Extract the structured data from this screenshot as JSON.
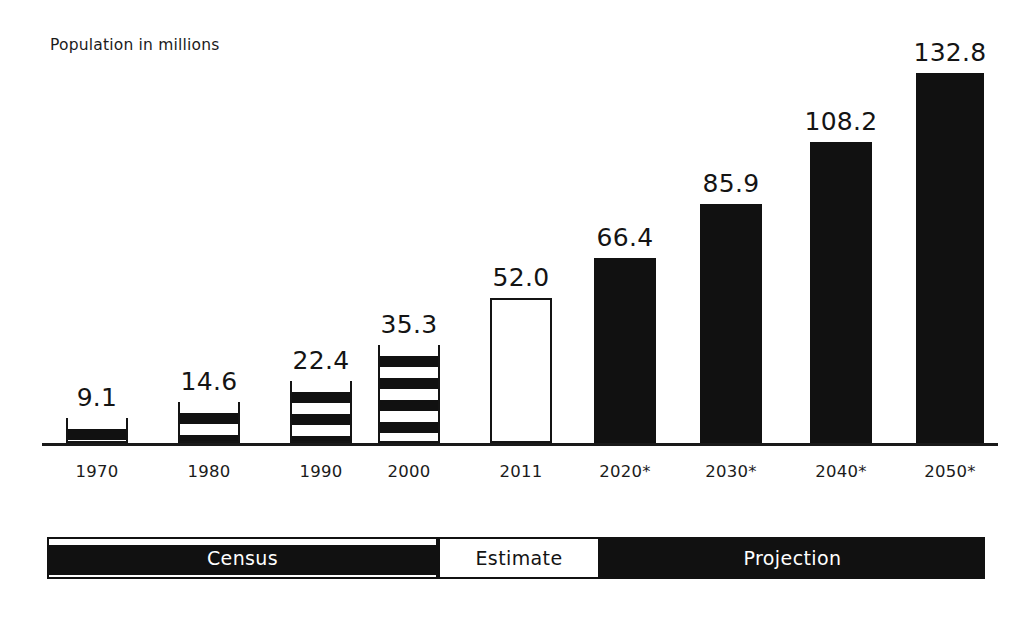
{
  "chart_data": {
    "type": "bar",
    "title": "",
    "subtitle": "",
    "ylabel": "Population in millions",
    "xlabel": "",
    "categories": [
      "1970",
      "1980",
      "1990",
      "2000",
      "2011",
      "2020*",
      "2030*",
      "2040*",
      "2050*"
    ],
    "values": [
      9.1,
      14.6,
      22.4,
      35.3,
      52.0,
      66.4,
      85.9,
      108.2,
      132.8
    ],
    "value_labels": [
      "9.1",
      "14.6",
      "22.4",
      "35.3",
      "52.0",
      "66.4",
      "85.9",
      "108.2",
      "132.8"
    ],
    "series": [
      {
        "name": "Population in millions",
        "values": [
          9.1,
          14.6,
          22.4,
          35.3,
          52.0,
          66.4,
          85.9,
          108.2,
          132.8
        ]
      }
    ],
    "bar_styles": [
      "striped",
      "striped",
      "striped",
      "striped",
      "hollow",
      "solid",
      "solid",
      "solid",
      "solid"
    ],
    "categories_by_group": {
      "Census": [
        "1970",
        "1980",
        "1990",
        "2000"
      ],
      "Estimate": [
        "2011"
      ],
      "Projection": [
        "2020*",
        "2030*",
        "2040*",
        "2050*"
      ]
    },
    "ylim": [
      0,
      132.8
    ],
    "grid": false,
    "legend_position": "bottom",
    "annotations": [
      "* denotes projected year"
    ],
    "colors": {
      "solid_fill": "#111111",
      "hollow_fill": "#ffffff",
      "outline": "#141414",
      "text": "#141414",
      "background": "#ffffff"
    }
  },
  "axis": {
    "caption": "Population in millions"
  },
  "bars": [
    {
      "label": "1970",
      "value": "9.1",
      "style": "striped",
      "x": 66,
      "width": 62
    },
    {
      "label": "1980",
      "value": "14.6",
      "style": "striped",
      "x": 178,
      "width": 62
    },
    {
      "label": "1990",
      "value": "22.4",
      "style": "striped",
      "x": 290,
      "width": 62
    },
    {
      "label": "2000",
      "value": "35.3",
      "style": "striped",
      "x": 378,
      "width": 62
    },
    {
      "label": "2011",
      "value": "52.0",
      "style": "hollow",
      "x": 490,
      "width": 62
    },
    {
      "label": "2020*",
      "value": "66.4",
      "style": "solid",
      "x": 594,
      "width": 62
    },
    {
      "label": "2030*",
      "value": "85.9",
      "style": "solid",
      "x": 700,
      "width": 62
    },
    {
      "label": "2040*",
      "value": "108.2",
      "style": "solid",
      "x": 810,
      "width": 62
    },
    {
      "label": "2050*",
      "value": "132.8",
      "style": "solid",
      "x": 916,
      "width": 68
    }
  ],
  "legend": {
    "segments": [
      {
        "label": "Census",
        "style": "census"
      },
      {
        "label": "Estimate",
        "style": "estimate"
      },
      {
        "label": "Projection",
        "style": "projection"
      }
    ]
  }
}
